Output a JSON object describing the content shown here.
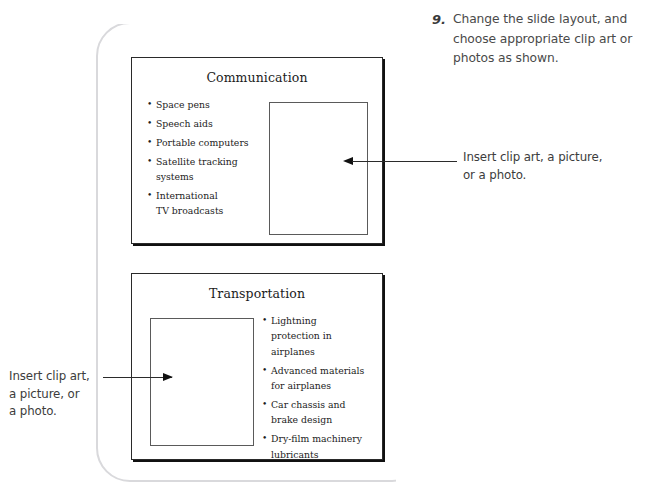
{
  "top_sliver": {
    "text": "appropriate clip art"
  },
  "step": {
    "number": "9.",
    "text": "Change the slide layout, and choose appropriate clip art or photos as shown."
  },
  "slides": [
    {
      "id": "slide-1",
      "title": "Communication",
      "bullets": [
        "Space pens",
        "Speech aids",
        "Portable computers",
        "Satellite tracking\nsystems",
        "International\nTV broadcasts"
      ],
      "placeholder_label": "picture-placeholder"
    },
    {
      "id": "slide-2",
      "title": "Transportation",
      "bullets": [
        "Lightning\nprotection in\nairplanes",
        "Advanced materials\nfor airplanes",
        "Car chassis and\nbrake design",
        "Dry-film machinery\nlubricants"
      ],
      "placeholder_label": "picture-placeholder"
    }
  ],
  "callouts": {
    "right": "Insert clip art, a picture,\nor a photo.",
    "left": "Insert clip art,\na picture, or\na photo."
  },
  "colors": {
    "slide_border": "#2a2a2a",
    "slide_shadow": "#111111",
    "placeholder_border": "#5a5a5a",
    "page_curl": "#d9d9dc",
    "text": "#1c1c1c",
    "callout_text": "#3c3c3c",
    "step_text": "#4a4a4a",
    "background": "#ffffff"
  }
}
